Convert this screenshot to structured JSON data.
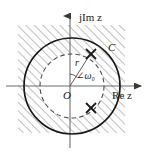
{
  "figure": {
    "width": 160,
    "height": 153,
    "background_color": "#ffffff"
  },
  "axes": {
    "imaginary": {
      "label": "jIm z",
      "label_parts": {
        "j": "j",
        "im": "Im",
        "var": "z"
      },
      "orientation": "vertical",
      "arrow": "up",
      "x": 70,
      "top": 14,
      "bottom": 148
    },
    "real": {
      "label": "Re z",
      "label_parts": {
        "re": "Re",
        "var": "z"
      },
      "orientation": "horizontal",
      "arrow": "right",
      "y": 86,
      "left": 6,
      "right": 143
    },
    "origin": {
      "label": "O",
      "x": 70,
      "y": 86
    },
    "axis_color": "#6e6e6e"
  },
  "contour": {
    "outer_circle": {
      "label": "C",
      "center_x": 72,
      "center_y": 86,
      "radius": 48,
      "style": "solid",
      "color": "#1a1a1a"
    },
    "inner_circle": {
      "center_x": 72,
      "center_y": 86,
      "radius": 32,
      "style": "dashed",
      "color": "#4d4d4d"
    }
  },
  "annotations": {
    "radius_label": "r",
    "angle_label": "∠ω₀",
    "angle_symbol": "∠",
    "omega_label": "ω₀",
    "contour_label": "C",
    "origin_label": "O"
  },
  "poles": [
    {
      "name": "pole-upper-right",
      "x": 91,
      "y": 54,
      "marker": "x-marker"
    },
    {
      "name": "pole-lower-right",
      "x": 91,
      "y": 108,
      "marker": "x-marker"
    }
  ],
  "hatched_region": {
    "x": 18,
    "y": 25,
    "width": 107,
    "height": 108,
    "pattern": "diagonal-hatch-45",
    "line_color": "#8c8c8c",
    "description": "region of convergence hatching outside inner dashed circle"
  },
  "colors": {
    "ink": "#1a1a1a",
    "axis": "#6e6e6e",
    "hatch": "#8c8c8c",
    "dashed": "#4d4d4d"
  }
}
